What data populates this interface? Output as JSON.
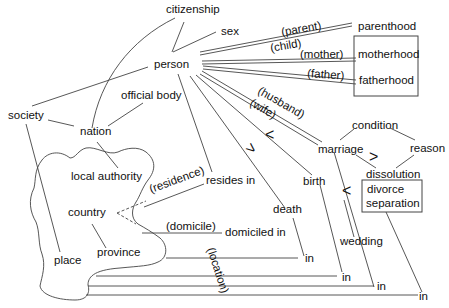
{
  "diagram": {
    "nodes": {
      "citizenship": "citizenship",
      "sex": "sex",
      "person": "person",
      "official_body": "official body",
      "society": "society",
      "nation": "nation",
      "local_authority": "local authority",
      "country": "country",
      "province": "province",
      "place": "place",
      "resides_in": "resides in",
      "domiciled_in": "domiciled in",
      "death": "death",
      "birth": "birth",
      "marriage": "marriage",
      "condition": "condition",
      "reason": "reason",
      "dissolution": "dissolution",
      "divorce": "divorce",
      "separation": "separation",
      "wedding": "wedding",
      "parenthood": "parenthood",
      "motherhood": "motherhood",
      "fatherhood": "fatherhood",
      "in1": "in",
      "in2": "in",
      "in3": "in",
      "in4": "in"
    },
    "edge_labels": {
      "parent": "(parent)",
      "child": "(child)",
      "mother": "(mother)",
      "father": "(father)",
      "husband": "(husband)",
      "wife": "(wife)",
      "residence": "(residence)",
      "domicile": "(domicile)",
      "location": "(location)"
    },
    "order_marks": {
      "gt1": ">",
      "lt1": "<",
      "gt2": ">",
      "lt2": "<"
    }
  }
}
